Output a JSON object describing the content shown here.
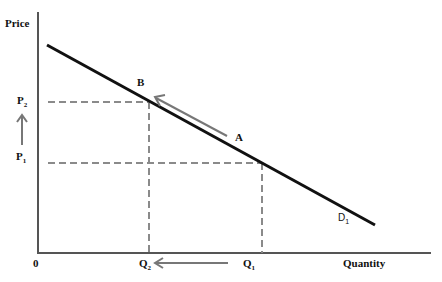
{
  "diagram": {
    "type": "demand-curve",
    "y_axis_label": "Price",
    "x_axis_label": "Quantity",
    "origin_label": "0",
    "curve_label": {
      "base": "D",
      "sub": "1"
    },
    "points": {
      "A": {
        "label": "A"
      },
      "B": {
        "label": "B"
      }
    },
    "price_levels": [
      {
        "base": "P",
        "sub": "2"
      },
      {
        "base": "P",
        "sub": "1"
      }
    ],
    "quantity_levels": [
      {
        "base": "Q",
        "sub": "2"
      },
      {
        "base": "Q",
        "sub": "1"
      }
    ],
    "annotations": [
      "arrow up from P1 to P2",
      "arrow along demand curve from A to B",
      "arrow left from Q1 to Q2"
    ],
    "colors": {
      "curve": "#111111",
      "dashed": "#8a8a8a",
      "arrow": "#777777",
      "axis": "#555555"
    }
  }
}
